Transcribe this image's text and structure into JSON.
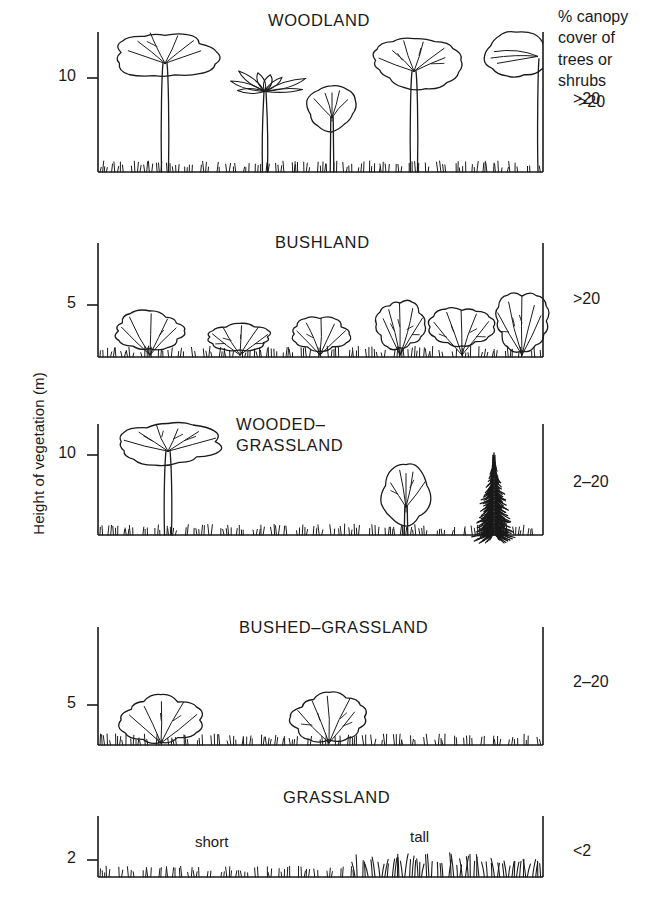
{
  "figure": {
    "y_axis_label": "Height of vegetation (m)",
    "header_note": "% canopy\ncover of\ntrees or\nshrubs",
    "header_note_value": ">20"
  },
  "chart_data": {
    "type": "diagram",
    "title": "",
    "ylabel": "Height of vegetation (m)",
    "xlabel": "",
    "grid": false,
    "legend": "none",
    "right_column_header": "% canopy cover of trees or shrubs",
    "panels": [
      {
        "name": "WOODLAND",
        "title": "WOODLAND",
        "title_x": 268,
        "title_y": 10,
        "tick_label": "10",
        "tick_value": 10,
        "tick_y": 78,
        "canopy_cover": ">20",
        "canopy_cover_y": 100,
        "axis_top": 32,
        "baseline_y": 172,
        "grass": "short",
        "plants": [
          {
            "kind": "broad-crown-tree",
            "x": 165,
            "crown_w": 96,
            "crown_h": 46,
            "top": 32
          },
          {
            "kind": "palm-tree",
            "x": 265,
            "crown_w": 78,
            "crown_h": 44,
            "top": 66
          },
          {
            "kind": "small-round-tree",
            "x": 332,
            "crown_w": 48,
            "crown_h": 44,
            "top": 86
          },
          {
            "kind": "broad-crown-tree",
            "x": 414,
            "crown_w": 86,
            "crown_h": 46,
            "top": 40
          },
          {
            "kind": "edge-half-tree",
            "x": 516,
            "crown_w": 62,
            "crown_h": 44,
            "top": 32
          }
        ]
      },
      {
        "name": "BUSHLAND",
        "title": "BUSHLAND",
        "title_x": 275,
        "title_y": 232,
        "tick_label": "5",
        "tick_value": 5,
        "tick_y": 305,
        "canopy_cover": ">20",
        "canopy_cover_y": 300,
        "axis_top": 243,
        "baseline_y": 357,
        "grass": "short",
        "plants": [
          {
            "kind": "shrub",
            "x": 150,
            "crown_w": 70,
            "crown_h": 36,
            "top": 313
          },
          {
            "kind": "shrub",
            "x": 240,
            "crown_w": 62,
            "crown_h": 26,
            "top": 324
          },
          {
            "kind": "shrub",
            "x": 320,
            "crown_w": 54,
            "crown_h": 32,
            "top": 318
          },
          {
            "kind": "shrub",
            "x": 400,
            "crown_w": 46,
            "crown_h": 48,
            "top": 300
          },
          {
            "kind": "shrub",
            "x": 462,
            "crown_w": 58,
            "crown_h": 38,
            "top": 308
          },
          {
            "kind": "shrub",
            "x": 522,
            "crown_w": 52,
            "crown_h": 54,
            "top": 294
          }
        ]
      },
      {
        "name": "WOODED-GRASSLAND",
        "title": "WOODED–\nGRASSLAND",
        "title_x": 236,
        "title_y": 414,
        "tick_label": "10",
        "tick_value": 10,
        "tick_y": 455,
        "canopy_cover": "2–20",
        "canopy_cover_y": 483,
        "axis_top": 424,
        "baseline_y": 535,
        "grass": "short",
        "plants": [
          {
            "kind": "broad-crown-tree",
            "x": 168,
            "crown_w": 100,
            "crown_h": 40,
            "top": 424
          },
          {
            "kind": "small-round-tree",
            "x": 406,
            "crown_w": 48,
            "crown_h": 60,
            "top": 464
          },
          {
            "kind": "conifer",
            "x": 494,
            "crown_w": 40,
            "crown_h": 82,
            "top": 453
          }
        ]
      },
      {
        "name": "BUSHED-GRASSLAND",
        "title": "BUSHED–GRASSLAND",
        "title_x": 239,
        "title_y": 617,
        "tick_label": "5",
        "tick_value": 5,
        "tick_y": 705,
        "canopy_cover": "2–20",
        "canopy_cover_y": 683,
        "axis_top": 627,
        "baseline_y": 745,
        "grass": "short",
        "plants": [
          {
            "kind": "shrub",
            "x": 161,
            "crown_w": 74,
            "crown_h": 46,
            "top": 697
          },
          {
            "kind": "shrub",
            "x": 329,
            "crown_w": 70,
            "crown_h": 46,
            "top": 694
          }
        ]
      },
      {
        "name": "GRASSLAND",
        "title": "GRASSLAND",
        "title_x": 283,
        "title_y": 787,
        "tick_label": "2",
        "tick_value": 2,
        "tick_y": 860,
        "canopy_cover": "<2",
        "canopy_cover_y": 852,
        "axis_top": 816,
        "baseline_y": 877,
        "grass": "short-and-tall",
        "ground_labels": [
          {
            "text": "short",
            "x": 195,
            "y": 843
          },
          {
            "text": "tall",
            "x": 410,
            "y": 838
          }
        ],
        "plants": []
      }
    ],
    "axis_left_x": 98,
    "axis_right_x": 543
  }
}
